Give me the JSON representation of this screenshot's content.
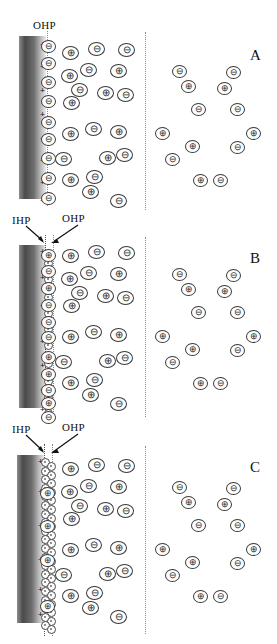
{
  "figure": {
    "panels": [
      {
        "id": "A",
        "letter": "A",
        "model": "Helmholtz model",
        "plane_labels": [
          {
            "name": "OHP",
            "text": "OHP",
            "has_arrow": false
          }
        ],
        "surface_charge_symbol": "+",
        "surface_charge_count": 8,
        "inner_layer_ion": "⊖",
        "inner_layer_count": 9,
        "has_solvent_layer": false
      },
      {
        "id": "B",
        "letter": "B",
        "model": "Gouy-Chapman-Stern model",
        "plane_labels": [
          {
            "name": "IHP",
            "text": "IHP",
            "has_arrow": true
          },
          {
            "name": "OHP",
            "text": "OHP",
            "has_arrow": true
          }
        ],
        "surface_charge_symbol": "+",
        "surface_charge_count": 7,
        "inner_layer_ion": "mixed",
        "inner_layer_count": 13,
        "has_solvent_layer": true
      },
      {
        "id": "C",
        "letter": "C",
        "model": "Bockris-Devanathan-Muller model",
        "plane_labels": [
          {
            "name": "IHP",
            "text": "IHP",
            "has_arrow": true
          },
          {
            "name": "OHP",
            "text": "OHP",
            "has_arrow": true
          }
        ],
        "surface_charge_symbol": "+",
        "surface_charge_count": 6,
        "inner_layer_ion": "⊕",
        "inner_layer_count": 5,
        "has_solvent_layer": true,
        "solvent_molecule_count": 26
      }
    ],
    "glyphs": {
      "cation": "⊕",
      "anion": "⊖",
      "solvent": "solvent-molecule"
    },
    "colors": {
      "electrode_dark": "#4a4a4a",
      "electrode_light": "#ebebeb",
      "ion_outline": "#3a3a3a",
      "plane_line": "#8a8a8a",
      "text": "#111111"
    },
    "regions": {
      "electrode": "electrode",
      "compact_layer": "compact-layer",
      "diffuse_layer": "diffuse-layer",
      "bulk_solution": "bulk-solution"
    },
    "diffuse_layer_ions": [
      {
        "charge": "⊕",
        "x": 62,
        "y": 46
      },
      {
        "charge": "⊖",
        "x": 88,
        "y": 42
      },
      {
        "charge": "⊖",
        "x": 118,
        "y": 43
      },
      {
        "charge": "⊕",
        "x": 61,
        "y": 69
      },
      {
        "charge": "⊖",
        "x": 80,
        "y": 63
      },
      {
        "charge": "⊕",
        "x": 110,
        "y": 64
      },
      {
        "charge": "⊖",
        "x": 71,
        "y": 83
      },
      {
        "charge": "⊕",
        "x": 97,
        "y": 86
      },
      {
        "charge": "⊖",
        "x": 117,
        "y": 88
      },
      {
        "charge": "⊕",
        "x": 63,
        "y": 96
      },
      {
        "charge": "⊕",
        "x": 62,
        "y": 127
      },
      {
        "charge": "⊖",
        "x": 85,
        "y": 122
      },
      {
        "charge": "⊕",
        "x": 110,
        "y": 125
      },
      {
        "charge": "⊖",
        "x": 55,
        "y": 152
      },
      {
        "charge": "⊕",
        "x": 99,
        "y": 151
      },
      {
        "charge": "⊖",
        "x": 116,
        "y": 148
      },
      {
        "charge": "⊕",
        "x": 62,
        "y": 173
      },
      {
        "charge": "⊖",
        "x": 86,
        "y": 170
      },
      {
        "charge": "⊕",
        "x": 82,
        "y": 185
      },
      {
        "charge": "⊖",
        "x": 110,
        "y": 194
      }
    ],
    "bulk_ions": [
      {
        "charge": "⊖",
        "x": 172,
        "y": 65
      },
      {
        "charge": "⊖",
        "x": 226,
        "y": 66
      },
      {
        "charge": "⊕",
        "x": 181,
        "y": 80
      },
      {
        "charge": "⊕",
        "x": 217,
        "y": 82
      },
      {
        "charge": "⊖",
        "x": 191,
        "y": 103
      },
      {
        "charge": "⊖",
        "x": 230,
        "y": 103
      },
      {
        "charge": "⊕",
        "x": 155,
        "y": 127
      },
      {
        "charge": "⊕",
        "x": 246,
        "y": 127
      },
      {
        "charge": "⊕",
        "x": 185,
        "y": 140
      },
      {
        "charge": "⊖",
        "x": 230,
        "y": 141
      },
      {
        "charge": "⊖",
        "x": 165,
        "y": 153
      },
      {
        "charge": "⊕",
        "x": 193,
        "y": 174
      },
      {
        "charge": "⊖",
        "x": 213,
        "y": 174
      }
    ],
    "panelA_inner_ions": [
      {
        "charge": "⊖",
        "y": 40
      },
      {
        "charge": "⊖",
        "y": 57
      },
      {
        "charge": "⊖",
        "y": 76
      },
      {
        "charge": "⊖",
        "y": 95
      },
      {
        "charge": "⊖",
        "y": 116
      },
      {
        "charge": "⊖",
        "y": 133
      },
      {
        "charge": "⊖",
        "y": 152
      },
      {
        "charge": "⊖",
        "y": 172
      },
      {
        "charge": "⊖",
        "y": 192
      }
    ],
    "panelB_inner_ions": [
      {
        "charge": "⊕",
        "y": 40
      },
      {
        "charge": "⊖",
        "y": 56
      },
      {
        "charge": "⊕",
        "y": 73
      },
      {
        "charge": "⊖",
        "y": 90
      },
      {
        "charge": "⊖",
        "y": 107
      },
      {
        "charge": "⊖",
        "y": 122
      },
      {
        "charge": "⊕",
        "y": 142
      },
      {
        "charge": "⊕",
        "y": 159
      },
      {
        "charge": "⊖",
        "y": 175
      },
      {
        "charge": "⊕",
        "y": 188
      },
      {
        "charge": "⊖",
        "y": 202
      }
    ],
    "panelC_inner_ions": [
      {
        "charge": "⊕",
        "y": 73
      },
      {
        "charge": "⊕",
        "y": 106
      },
      {
        "charge": "⊕",
        "y": 140
      },
      {
        "charge": "⊕",
        "y": 186
      }
    ]
  }
}
